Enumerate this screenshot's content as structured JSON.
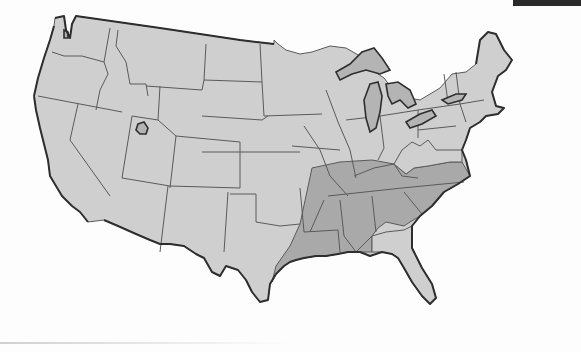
{
  "map": {
    "title": "Contiguous United States",
    "colors": {
      "land": "#cfcfcf",
      "shaded_region": "#a9a9a9",
      "lakes": "#b4b4b4",
      "state_border": "#5a5a5a",
      "coastline": "#2e2e2e",
      "background": "#fdfdfd"
    },
    "shaded_region": {
      "description": "Southeastern states highlighted",
      "states": [
        "Arkansas",
        "Louisiana",
        "Mississippi",
        "Alabama",
        "Georgia",
        "South Carolina",
        "North Carolina",
        "Tennessee",
        "Kentucky (southern)",
        "Missouri (southern)",
        "Illinois (southern)",
        "Indiana (southern)",
        "Virginia (southern)",
        "Oklahoma (eastern edge)",
        "Texas (eastern edge)"
      ]
    },
    "unshaded_in_southeast": [
      "Florida",
      "West Virginia",
      "northern Virginia"
    ],
    "features": [
      "Great Lakes",
      "Great Salt Lake",
      "Puget Sound"
    ]
  }
}
